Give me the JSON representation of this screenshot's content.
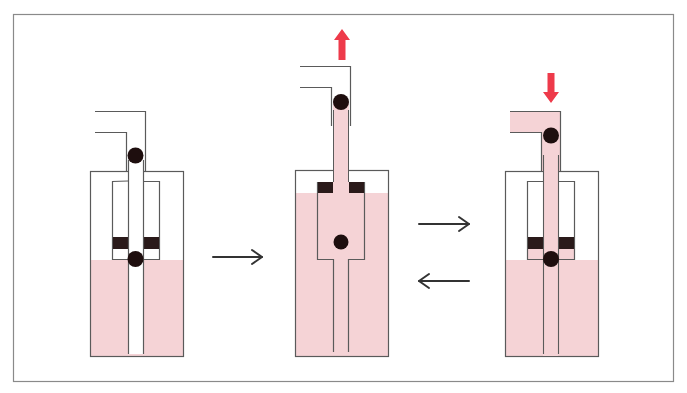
{
  "diagram": {
    "title": "",
    "colors": {
      "frame": "#8a8a8a",
      "line": "#5a5a5a",
      "fluid": "#f5d3d6",
      "valve_block": "#2a1a1a",
      "ball": "#1e0e0e",
      "motion_arrow": "#ee3a4a",
      "flow_arrow": "#333333",
      "background": "#ffffff"
    },
    "panels": [
      {
        "id": "stage-1",
        "state": "rest",
        "motion": "none",
        "valve_balls": [
          "outlet-seated",
          "inlet-seated"
        ]
      },
      {
        "id": "stage-2",
        "state": "intake",
        "motion": "up",
        "valve_balls": [
          "outlet-seated",
          "inlet-open"
        ]
      },
      {
        "id": "stage-3",
        "state": "discharge",
        "motion": "down",
        "valve_balls": [
          "outlet-open",
          "inlet-seated"
        ]
      }
    ],
    "arrows": [
      {
        "id": "arrow-1-to-2",
        "direction": "right"
      },
      {
        "id": "arrow-2-to-3",
        "direction": "right"
      },
      {
        "id": "arrow-3-to-2",
        "direction": "left"
      },
      {
        "id": "motion-up",
        "direction": "up"
      },
      {
        "id": "motion-down",
        "direction": "down"
      }
    ]
  }
}
